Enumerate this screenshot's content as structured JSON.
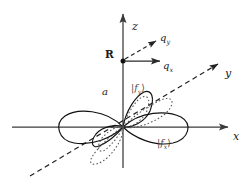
{
  "figure": {
    "title": "",
    "background_color": "#ffffff",
    "axis_color": "#3a3a3a",
    "orbital_solid_color": "#111111",
    "orbital_dotted_color": "#555555",
    "dashed_color": "#222222"
  },
  "axes": [
    {
      "name": "z-axis",
      "label": "z",
      "style": "solid",
      "direction": "up"
    },
    {
      "name": "x-axis",
      "label": "x",
      "style": "solid",
      "direction": "right"
    },
    {
      "name": "y-axis",
      "label": "y",
      "style": "dashed",
      "direction": "upper-right-diagonal"
    }
  ],
  "labels": {
    "z_axis": "z",
    "x_axis": "x",
    "y_axis": "y",
    "site_point": "R",
    "distance": "a",
    "q_x_vector": "q",
    "q_x_subscript": "x",
    "q_y_vector": "q",
    "q_y_subscript": "y",
    "ket_fx_open": "|f",
    "ket_fx_subscript": "x",
    "ket_fx_close": "⟩",
    "ket_fy_open": "|f",
    "ket_fy_subscript": "y",
    "ket_fy_close": "⟩"
  },
  "vectors": [
    {
      "name": "q-x-vector",
      "label": "q_x",
      "style": "solid",
      "origin": "R",
      "direction": "right"
    },
    {
      "name": "q-y-vector",
      "label": "q_y",
      "style": "dashed",
      "origin": "R",
      "direction": "upper-right"
    }
  ],
  "orbitals": [
    {
      "name": "f-x-orbital",
      "label": "|f_x⟩",
      "style": "solid",
      "lobes": 4,
      "oriented_along": "x"
    },
    {
      "name": "f-y-orbital",
      "label": "|f_y⟩",
      "style": "dotted",
      "lobes": 4,
      "oriented_along": "y"
    }
  ],
  "points": [
    {
      "name": "site-point-R",
      "label": "R",
      "on_axis": "z",
      "height_label": "a"
    },
    {
      "name": "origin",
      "label": "",
      "on_axis": "origin"
    }
  ]
}
